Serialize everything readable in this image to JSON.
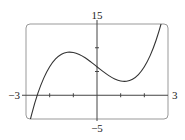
{
  "chart_data": {
    "type": "line",
    "title": "",
    "xlabel": "",
    "ylabel": "",
    "xlim": [
      -3,
      3
    ],
    "ylim": [
      -5,
      15
    ],
    "grid": false,
    "legend": null,
    "tick_labels": {
      "x_min": "−3",
      "x_max": "3",
      "y_min": "−5",
      "y_max": "15"
    },
    "x_ticks": [
      -2,
      -1,
      1,
      2
    ],
    "y_ticks": [
      5,
      10
    ],
    "series": [
      {
        "name": "curve",
        "x": [
          -3,
          -2.75,
          -2.5,
          -2.25,
          -2,
          -1.75,
          -1.5,
          -1.25,
          -1,
          -0.75,
          -0.5,
          -0.25,
          0,
          0.25,
          0.5,
          0.75,
          1,
          1.25,
          1.5,
          1.75,
          2,
          2.25,
          2.5,
          2.75,
          3
        ],
        "y": [
          -9,
          -3.8,
          0.38,
          3.61,
          6,
          7.64,
          8.63,
          9.05,
          9,
          8.58,
          7.88,
          6.98,
          6,
          5.02,
          4.13,
          3.42,
          3,
          2.95,
          3.38,
          4.36,
          6,
          8.39,
          11.63,
          15.8,
          21
        ]
      }
    ],
    "frame": "rounded-rectangle"
  }
}
